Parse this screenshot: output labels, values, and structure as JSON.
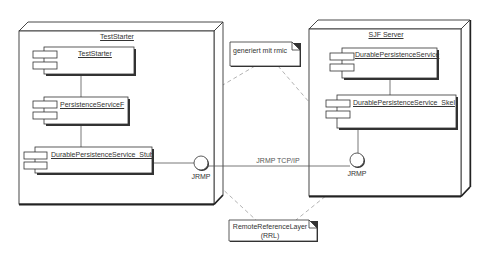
{
  "diagram": {
    "type": "UML deployment diagram",
    "nodes": [
      {
        "id": "teststarter-node",
        "label": "TestStarter",
        "components": [
          {
            "label": "TestStarter"
          },
          {
            "label": "PersistenceServiceF"
          },
          {
            "label": "DurablePersistenceService_Stub"
          }
        ],
        "interface": {
          "label": "JRMP"
        }
      },
      {
        "id": "sjf-server-node",
        "label": "SJF Server",
        "components": [
          {
            "label": "DurablePersistenceService"
          },
          {
            "label": "DurablePersistenceService_Skel"
          }
        ],
        "interface": {
          "label": "JRMP"
        }
      }
    ],
    "connection": {
      "label": "JRMP TCP/IP"
    },
    "notes": [
      {
        "id": "rmic-note",
        "text": "generiert mit rmic"
      },
      {
        "id": "rrl-note",
        "line1": "RemoteReferenceLayer",
        "line2": "(RRL)"
      }
    ],
    "colors": {
      "line": "#333333",
      "dashed": "#999999",
      "fill": "#ffffff"
    }
  }
}
